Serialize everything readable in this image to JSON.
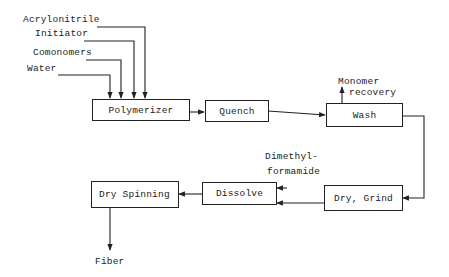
{
  "diagram": {
    "inputs": [
      {
        "label": "Acrylonitrile"
      },
      {
        "label": "Initiator"
      },
      {
        "label": "Comonomers"
      },
      {
        "label": "Water"
      }
    ],
    "nodes": [
      {
        "id": "polymerizer",
        "label": "Polymerizer"
      },
      {
        "id": "quench",
        "label": "Quench"
      },
      {
        "id": "wash",
        "label": "Wash"
      },
      {
        "id": "dry_grind",
        "label": "Dry, Grind"
      },
      {
        "id": "dissolve",
        "label": "Dissolve"
      },
      {
        "id": "dry_spinning",
        "label": "Dry Spinning"
      }
    ],
    "side_streams": {
      "monomer_recovery_line1": "Monomer",
      "monomer_recovery_line2": "recovery",
      "solvent_line1": "Dimethyl-",
      "solvent_line2": "formamide"
    },
    "output": {
      "label": "Fiber"
    },
    "edges": [
      [
        "Acrylonitrile",
        "Polymerizer"
      ],
      [
        "Initiator",
        "Polymerizer"
      ],
      [
        "Comonomers",
        "Polymerizer"
      ],
      [
        "Water",
        "Polymerizer"
      ],
      [
        "Polymerizer",
        "Quench"
      ],
      [
        "Quench",
        "Wash"
      ],
      [
        "Wash",
        "Monomer recovery"
      ],
      [
        "Wash",
        "Dry, Grind"
      ],
      [
        "Dry, Grind",
        "Dissolve"
      ],
      [
        "Dimethylformamide",
        "Dissolve"
      ],
      [
        "Dissolve",
        "Dry Spinning"
      ],
      [
        "Dry Spinning",
        "Fiber"
      ]
    ]
  }
}
